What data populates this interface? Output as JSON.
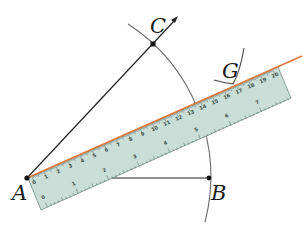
{
  "diagram": {
    "title": "",
    "points": [
      {
        "id": "A",
        "label": "A",
        "x": 27,
        "y": 178
      },
      {
        "id": "B",
        "label": "B",
        "x": 209,
        "y": 178
      },
      {
        "id": "C",
        "label": "C",
        "x": 153,
        "y": 44
      },
      {
        "id": "G",
        "label": "G",
        "x": 234,
        "y": 83
      }
    ],
    "segments": [
      {
        "from": "A",
        "to": "B"
      },
      {
        "from": "A",
        "to": "C",
        "extends_as_ray": true,
        "arrow": true
      }
    ],
    "arcs": [
      {
        "name": "arc-centered-A-through-B-and-C",
        "center": "A",
        "radius": 182
      },
      {
        "name": "arc-at-G",
        "near": "G"
      }
    ],
    "constructed_line": {
      "from": "A",
      "through": "G",
      "color": "#e0783c"
    },
    "ruler": {
      "color": "#c9ded6",
      "edge_color": "#6f8f84",
      "cm_labels": [
        "0",
        "1",
        "2",
        "3",
        "4",
        "5",
        "6",
        "7",
        "8",
        "9",
        "10",
        "11",
        "12",
        "13",
        "14",
        "15",
        "16",
        "17",
        "18",
        "19",
        "20"
      ],
      "inch_labels": [
        "0",
        "1",
        "2",
        "3",
        "4",
        "5",
        "6",
        "7",
        "8"
      ]
    },
    "colors": {
      "line": "#222222",
      "arc": "#555555",
      "point": "#111111",
      "orange_line": "#e0783c"
    }
  }
}
